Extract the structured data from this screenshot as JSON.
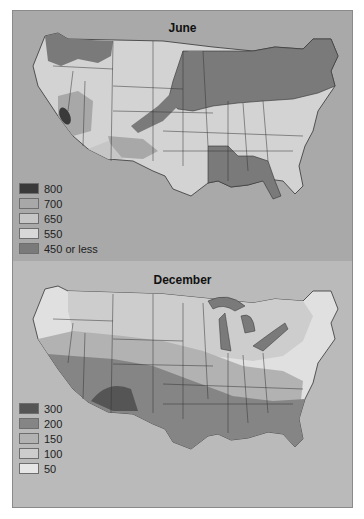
{
  "figure": {
    "panels": [
      {
        "title": "June",
        "legend": [
          {
            "label": "800",
            "color": "#3a3a3a"
          },
          {
            "label": "700",
            "color": "#a8a8a8"
          },
          {
            "label": "650",
            "color": "#c6c6c6"
          },
          {
            "label": "550",
            "color": "#d8d8d8"
          },
          {
            "label": "450 or less",
            "color": "#7a7a7a"
          }
        ]
      },
      {
        "title": "December",
        "legend": [
          {
            "label": "300",
            "color": "#555555"
          },
          {
            "label": "200",
            "color": "#858585"
          },
          {
            "label": "150",
            "color": "#b2b2b2"
          },
          {
            "label": "100",
            "color": "#cdcdcd"
          },
          {
            "label": "50",
            "color": "#e6e6e6"
          }
        ]
      }
    ]
  },
  "colors": {
    "frame_bg": "#b3b3b3",
    "border": "#8a8a8a",
    "state_lines": "#333333"
  }
}
